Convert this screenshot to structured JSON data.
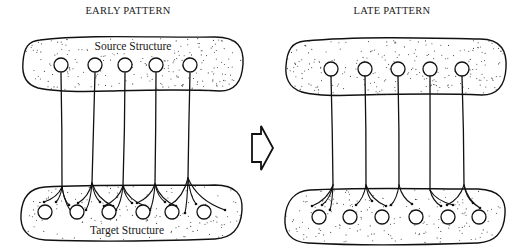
{
  "figure": {
    "panels": [
      {
        "id": "early",
        "title": "EARLY PATTERN",
        "source_label": "Source Structure",
        "target_label": "Target Structure",
        "source_cell_count": 5,
        "target_cell_count": 6,
        "connectivity": "diffuse",
        "branches_per_axon": 4
      },
      {
        "id": "late",
        "title": "LATE PATTERN",
        "source_label": "",
        "target_label": "",
        "source_cell_count": 5,
        "target_cell_count": 6,
        "connectivity": "refined",
        "branches_per_axon": 2
      }
    ],
    "transition_arrow": "right-arrow",
    "colors": {
      "ink": "#111111",
      "background": "#ffffff"
    }
  }
}
